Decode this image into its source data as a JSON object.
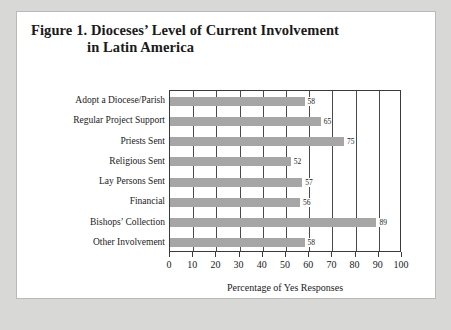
{
  "figure": {
    "title_line1": "Figure 1.  Dioceses’ Level of Current Involvement",
    "title_line2": "in Latin America"
  },
  "chart_data": {
    "type": "bar",
    "orientation": "horizontal",
    "title": "Figure 1.  Dioceses’ Level of Current Involvement in Latin America",
    "categories": [
      "Adopt a Diocese/Parish",
      "Regular Project Support",
      "Priests Sent",
      "Religious Sent",
      "Lay Persons Sent",
      "Financial",
      "Bishops’ Collection",
      "Other Involvement"
    ],
    "values": [
      58,
      65,
      75,
      52,
      57,
      56,
      89,
      58
    ],
    "xlabel": "Percentage of Yes Responses",
    "ylabel": "",
    "xlim": [
      0,
      100
    ],
    "xticks": [
      0,
      10,
      20,
      30,
      40,
      50,
      60,
      70,
      80,
      90,
      100
    ],
    "grid": "vertical",
    "legend": "none",
    "bar_color": "#a6a6a6",
    "axis_color": "#3a3a3a"
  }
}
